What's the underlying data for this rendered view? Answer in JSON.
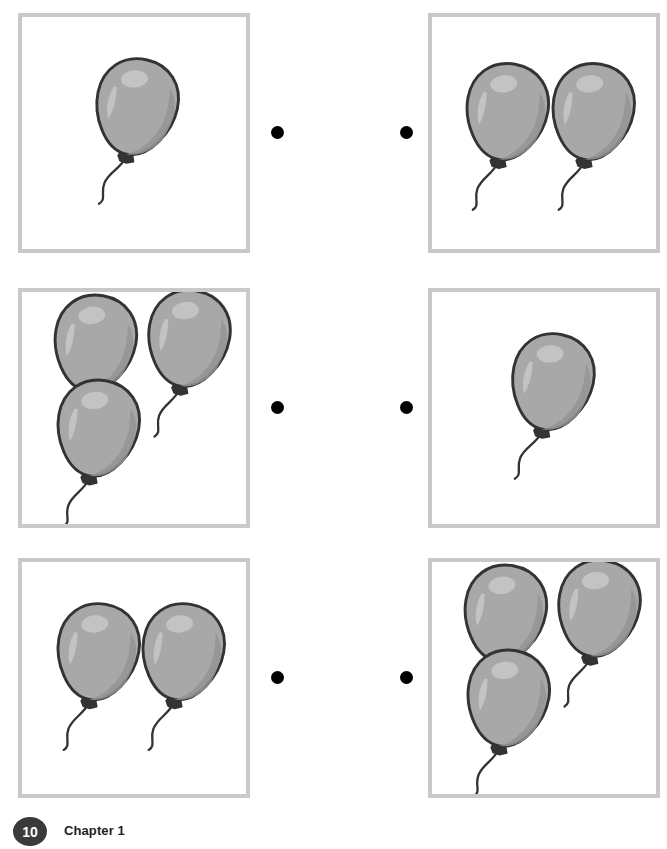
{
  "page": {
    "title": "Match.",
    "number": "10",
    "chapter_label": "Chapter 1"
  },
  "colors": {
    "box_border": "#c9c9c9",
    "dot": "#000000",
    "balloon_fill": "#a8a8a8",
    "balloon_shadow": "#949494",
    "balloon_outline": "#333333",
    "balloon_highlight": "#c4c4c4",
    "badge_background": "#3a3a3a",
    "page_background": "#ffffff"
  },
  "exercise": {
    "type": "match-by-count",
    "instruction": "Match.",
    "rows": [
      {
        "row_label": "row-1",
        "left": {
          "box_label": "box-row1-left",
          "balloon_count": 1,
          "balloons": [
            {
              "x": 118,
              "y": 95,
              "scale": 1.0,
              "rotate": 12
            }
          ]
        },
        "right": {
          "box_label": "box-row1-right",
          "balloon_count": 2,
          "balloons": [
            {
              "x": 77,
              "y": 100,
              "scale": 1.0,
              "rotate": 10
            },
            {
              "x": 166,
              "y": 100,
              "scale": 1.0,
              "rotate": 10
            }
          ]
        },
        "dots": {
          "left": "dot-row1-left",
          "right": "dot-row1-right"
        }
      },
      {
        "row_label": "row-2",
        "left": {
          "box_label": "box-row2-left",
          "balloon_count": 3,
          "balloons": [
            {
              "x": 75,
              "y": 55,
              "scale": 1.0,
              "rotate": 10
            },
            {
              "x": 172,
              "y": 50,
              "scale": 1.0,
              "rotate": 10
            },
            {
              "x": 78,
              "y": 143,
              "scale": 1.0,
              "rotate": 10
            }
          ]
        },
        "right": {
          "box_label": "box-row2-right",
          "balloon_count": 1,
          "balloons": [
            {
              "x": 124,
              "y": 95,
              "scale": 1.0,
              "rotate": 12
            }
          ]
        },
        "dots": {
          "left": "dot-row2-left",
          "right": "dot-row2-right"
        }
      },
      {
        "row_label": "row-3",
        "left": {
          "box_label": "box-row3-left",
          "balloon_count": 2,
          "balloons": [
            {
              "x": 78,
              "y": 95,
              "scale": 1.0,
              "rotate": 10
            },
            {
              "x": 166,
              "y": 95,
              "scale": 1.0,
              "rotate": 10
            }
          ]
        },
        "right": {
          "box_label": "box-row3-right",
          "balloon_count": 3,
          "balloons": [
            {
              "x": 75,
              "y": 55,
              "scale": 1.0,
              "rotate": 10
            },
            {
              "x": 172,
              "y": 50,
              "scale": 1.0,
              "rotate": 10
            },
            {
              "x": 78,
              "y": 143,
              "scale": 1.0,
              "rotate": 10
            }
          ]
        },
        "dots": {
          "left": "dot-row3-left",
          "right": "dot-row3-right"
        }
      }
    ]
  }
}
